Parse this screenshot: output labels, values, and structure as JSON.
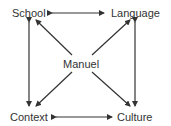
{
  "diagram": {
    "center": {
      "label": "Manuel"
    },
    "nodes": [
      {
        "id": "school",
        "label": "School"
      },
      {
        "id": "language",
        "label": "Language"
      },
      {
        "id": "context",
        "label": "Context"
      },
      {
        "id": "culture",
        "label": "Culture"
      }
    ],
    "edges": [
      {
        "from": "school",
        "to": "language",
        "type": "bidirectional"
      },
      {
        "from": "context",
        "to": "culture",
        "type": "bidirectional"
      },
      {
        "from": "school",
        "to": "context",
        "type": "bidirectional"
      },
      {
        "from": "language",
        "to": "culture",
        "type": "bidirectional"
      },
      {
        "from": "manuel",
        "to": "school",
        "type": "directed"
      },
      {
        "from": "manuel",
        "to": "language",
        "type": "directed"
      },
      {
        "from": "manuel",
        "to": "context",
        "type": "directed"
      },
      {
        "from": "manuel",
        "to": "culture",
        "type": "directed"
      }
    ],
    "colors": {
      "line": "#333333",
      "text": "#333333"
    }
  }
}
